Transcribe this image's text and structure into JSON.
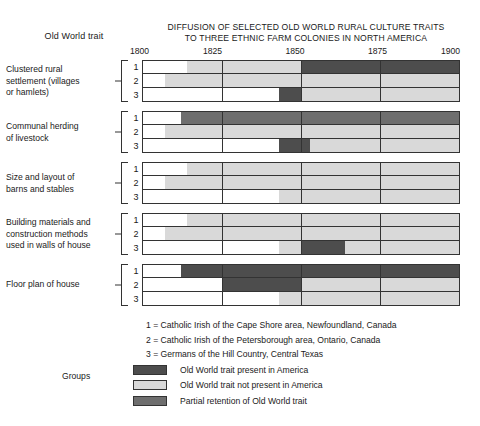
{
  "header": {
    "column_header": "Old World trait",
    "title_line_1": "DIFFUSION OF SELECTED OLD WORLD RURAL CULTURE TRAITS",
    "title_line_2": "TO THREE ETHNIC FARM COLONIES IN NORTH AMERICA"
  },
  "colors": {
    "present": "#4d4d4d",
    "not_present": "#d9d9d9",
    "partial": "#6e6e6e",
    "blank": "#ffffff",
    "ink": "#333333"
  },
  "chart_data": {
    "type": "bar",
    "title": "DIFFUSION OF SELECTED OLD WORLD RURAL CULTURE TRAITS TO THREE ETHNIC FARM COLONIES IN NORTH AMERICA",
    "xlabel": "",
    "ylabel": "Old World trait",
    "xlim": [
      1800,
      1900
    ],
    "ticks": [
      1800,
      1825,
      1850,
      1875,
      1900
    ],
    "tick_labels": [
      "1800",
      "1825",
      "1850",
      "1875",
      "1900"
    ],
    "grid": true,
    "legend_position": "bottom",
    "state_legend": [
      {
        "key": "present",
        "label": "Old World trait present in America",
        "color": "#4d4d4d"
      },
      {
        "key": "not_present",
        "label": "Old World trait not present in America",
        "color": "#d9d9d9"
      },
      {
        "key": "partial",
        "label": "Partial retention of Old World trait",
        "color": "#6e6e6e"
      }
    ],
    "groups": [
      {
        "id": 1,
        "label_lines": [
          "Clustered rural",
          "settlement (villages",
          "or hamlets)"
        ],
        "rows": [
          {
            "num": "1",
            "segments": [
              {
                "start": 1800,
                "end": 1814,
                "state": "blank"
              },
              {
                "start": 1814,
                "end": 1850,
                "state": "not_present"
              },
              {
                "start": 1850,
                "end": 1900,
                "state": "present"
              }
            ]
          },
          {
            "num": "2",
            "segments": [
              {
                "start": 1800,
                "end": 1807,
                "state": "blank"
              },
              {
                "start": 1807,
                "end": 1900,
                "state": "not_present"
              }
            ]
          },
          {
            "num": "3",
            "segments": [
              {
                "start": 1800,
                "end": 1843,
                "state": "blank"
              },
              {
                "start": 1843,
                "end": 1850,
                "state": "present"
              },
              {
                "start": 1850,
                "end": 1900,
                "state": "not_present"
              }
            ]
          }
        ]
      },
      {
        "id": 2,
        "label_lines": [
          "Communal herding",
          "of livestock"
        ],
        "rows": [
          {
            "num": "1",
            "segments": [
              {
                "start": 1800,
                "end": 1812,
                "state": "blank"
              },
              {
                "start": 1812,
                "end": 1900,
                "state": "partial"
              }
            ]
          },
          {
            "num": "2",
            "segments": [
              {
                "start": 1800,
                "end": 1807,
                "state": "blank"
              },
              {
                "start": 1807,
                "end": 1900,
                "state": "not_present"
              }
            ]
          },
          {
            "num": "3",
            "segments": [
              {
                "start": 1800,
                "end": 1843,
                "state": "blank"
              },
              {
                "start": 1843,
                "end": 1853,
                "state": "present"
              },
              {
                "start": 1853,
                "end": 1900,
                "state": "not_present"
              }
            ]
          }
        ]
      },
      {
        "id": 3,
        "label_lines": [
          "Size and layout of",
          "barns and stables"
        ],
        "rows": [
          {
            "num": "1",
            "segments": [
              {
                "start": 1800,
                "end": 1814,
                "state": "blank"
              },
              {
                "start": 1814,
                "end": 1900,
                "state": "not_present"
              }
            ]
          },
          {
            "num": "2",
            "segments": [
              {
                "start": 1800,
                "end": 1807,
                "state": "blank"
              },
              {
                "start": 1807,
                "end": 1900,
                "state": "not_present"
              }
            ]
          },
          {
            "num": "3",
            "segments": [
              {
                "start": 1800,
                "end": 1843,
                "state": "blank"
              },
              {
                "start": 1843,
                "end": 1900,
                "state": "not_present"
              }
            ]
          }
        ]
      },
      {
        "id": 4,
        "label_lines": [
          "Building materials and",
          "construction methods",
          "used in walls of house"
        ],
        "rows": [
          {
            "num": "1",
            "segments": [
              {
                "start": 1800,
                "end": 1814,
                "state": "blank"
              },
              {
                "start": 1814,
                "end": 1900,
                "state": "not_present"
              }
            ]
          },
          {
            "num": "2",
            "segments": [
              {
                "start": 1800,
                "end": 1807,
                "state": "blank"
              },
              {
                "start": 1807,
                "end": 1900,
                "state": "not_present"
              }
            ]
          },
          {
            "num": "3",
            "segments": [
              {
                "start": 1800,
                "end": 1843,
                "state": "blank"
              },
              {
                "start": 1843,
                "end": 1850,
                "state": "not_present"
              },
              {
                "start": 1850,
                "end": 1864,
                "state": "present"
              },
              {
                "start": 1864,
                "end": 1900,
                "state": "not_present"
              }
            ]
          }
        ]
      },
      {
        "id": 5,
        "label_lines": [
          "Floor plan of house"
        ],
        "rows": [
          {
            "num": "1",
            "segments": [
              {
                "start": 1800,
                "end": 1812,
                "state": "blank"
              },
              {
                "start": 1812,
                "end": 1900,
                "state": "present"
              }
            ]
          },
          {
            "num": "2",
            "segments": [
              {
                "start": 1800,
                "end": 1825,
                "state": "blank"
              },
              {
                "start": 1825,
                "end": 1850,
                "state": "present"
              },
              {
                "start": 1850,
                "end": 1900,
                "state": "not_present"
              }
            ]
          },
          {
            "num": "3",
            "segments": [
              {
                "start": 1800,
                "end": 1843,
                "state": "blank"
              },
              {
                "start": 1843,
                "end": 1900,
                "state": "not_present"
              }
            ]
          }
        ]
      }
    ]
  },
  "group_key": {
    "line_1": "1 = Catholic Irish of the Cape Shore area, Newfoundland, Canada",
    "line_2": "2 = Catholic Irish of the Petersborough area, Ontario, Canada",
    "line_3": "3 = Germans of the Hill Country, Central Texas"
  },
  "groups_word": "Groups"
}
